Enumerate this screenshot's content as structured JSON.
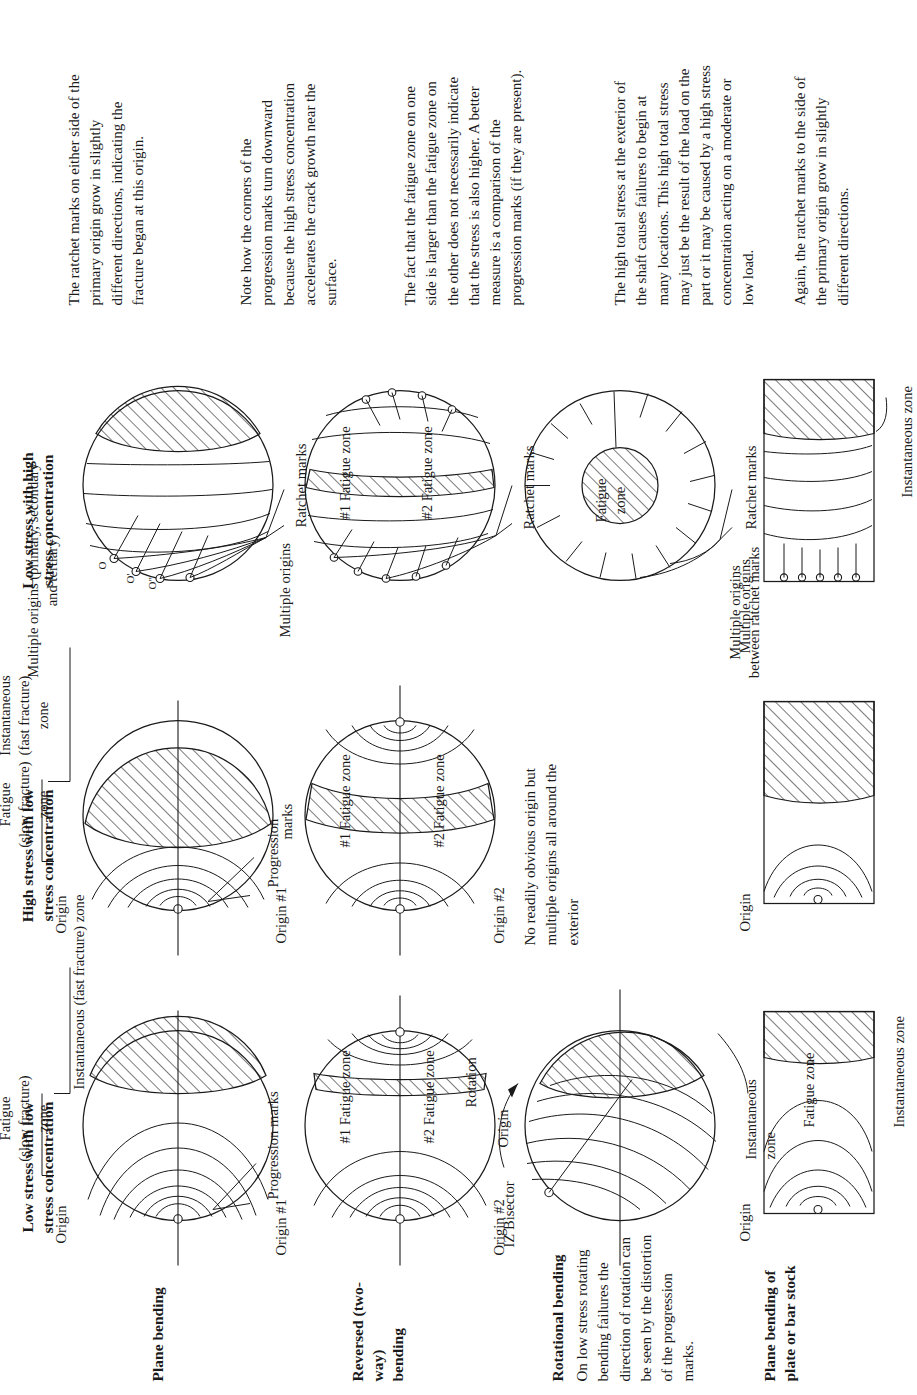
{
  "figure": {
    "title_hidden": "",
    "columns": [
      {
        "id": "col1",
        "label": "Low stress with low\nstress concentration"
      },
      {
        "id": "col2",
        "label": "High stress with low\nstress concentration"
      },
      {
        "id": "col3",
        "label": "Low stress with high\nstress concentration"
      }
    ],
    "rows": [
      {
        "id": "row1",
        "label": "Plane bending",
        "note": ""
      },
      {
        "id": "row2",
        "label": "Reversed (two-way)\nbending",
        "note": ""
      },
      {
        "id": "row3",
        "label": "Rotational bending",
        "note": "On low stress rotating bending failures the direction of rotation can be seen by the distortion of the progression marks."
      },
      {
        "id": "row4",
        "label": "Plane bending of\nplate or bar stock",
        "note": ""
      }
    ]
  },
  "labels": {
    "origin": "Origin",
    "origin_1": "Origin #1",
    "origin_2": "Origin #2",
    "progression_marks": "Progression marks",
    "progression": "Progression",
    "marks": "marks",
    "ratchet_marks": "Ratchet marks",
    "multiple_origins": "Multiple origins",
    "multiple_origins_between": "Multiple origins\nbetween ratchet marks",
    "multiple_origins_pst": "Multiple origins (primary, secondary\nand tertiary)",
    "fatigue_slow_1": "Fatigue",
    "fatigue_slow_2": "(slow fracture)",
    "fatigue_slow_3": "zone",
    "instantaneous_fast_inline": "Instantaneous (fast fracture) zone",
    "instantaneous_fast_1": "Instantaneous",
    "instantaneous_fast_2": "(fast fracture)",
    "instantaneous_fast_3": "zone",
    "fatigue_zone": "Fatigue zone",
    "fatigue_zone_2line": "Fatigue\nzone",
    "fz1": "#1 Fatigue zone",
    "fz2": "#2 Fatigue zone",
    "iz_bisector": "IZ Bisector",
    "rotation": "Rotation",
    "instantaneous_zone": "Instantaneous zone",
    "instantaneous_zone_2line": "Instantaneous\nzone",
    "no_obvious_origin": "No readily obvious origin but multiple origins all around the exterior",
    "origin_primary": "O",
    "origin_secondary": "O'",
    "origin_tertiary": "O\""
  },
  "notes": [
    {
      "id": "note-1",
      "text": "The ratchet marks on either side of the primary origin grow in slightly different directions, indicating the fracture began at this origin."
    },
    {
      "id": "note-2",
      "text": "Note how the corners of the progression marks turn down­ward because the high stress concentration accelerates the crack growth near the surface."
    },
    {
      "id": "note-3",
      "text": "The fact that the fatigue zone on one side is larger than the fatigue zone on the other does not necessarily indicate that the stress is also higher. A better measure is a comparison of the progression marks (if they are present)."
    },
    {
      "id": "note-4",
      "text": "The high total stress at the exterior of the shaft causes failures to begin at many locations. This high total stress may just be the result of the load on the part or it may be caused by a high stress concentration acting on a moderate or low load."
    },
    {
      "id": "note-5",
      "text": "Again, the ratchet marks to the side of the primary origin grow in slightly different directions."
    }
  ],
  "colors": {
    "ink": "#1a1a1a",
    "paper": "#ffffff"
  }
}
